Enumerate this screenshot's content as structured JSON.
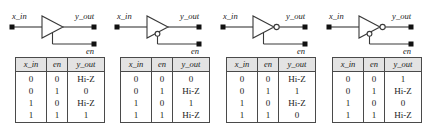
{
  "figure": {
    "background": "#ffffff",
    "line_color": "#3a3a3a",
    "header_fill": "#e3e3e3",
    "border_color": "#4a4a4a",
    "text_color": "#1a1a1a"
  },
  "columns": [
    "x_in",
    "en",
    "y_out"
  ],
  "panels": [
    {
      "id": "tristate-buffer-active-high",
      "signals": {
        "input": "x_in",
        "output": "y_out",
        "enable": "en"
      },
      "gate": {
        "type": "buffer",
        "output_bubble": false,
        "enable_bubble": false
      },
      "rows": [
        [
          "0",
          "0",
          "Hi-Z"
        ],
        [
          "0",
          "1",
          "0"
        ],
        [
          "1",
          "0",
          "Hi-Z"
        ],
        [
          "1",
          "1",
          "1"
        ]
      ]
    },
    {
      "id": "tristate-buffer-active-low",
      "signals": {
        "input": "x_in",
        "output": "y_out",
        "enable": "en"
      },
      "gate": {
        "type": "buffer",
        "output_bubble": false,
        "enable_bubble": true
      },
      "rows": [
        [
          "0",
          "0",
          "0"
        ],
        [
          "0",
          "1",
          "Hi-Z"
        ],
        [
          "1",
          "0",
          "1"
        ],
        [
          "1",
          "1",
          "Hi-Z"
        ]
      ]
    },
    {
      "id": "tristate-inverter-active-high",
      "signals": {
        "input": "x_in",
        "output": "y_out",
        "enable": "en"
      },
      "gate": {
        "type": "inverter",
        "output_bubble": true,
        "enable_bubble": false
      },
      "rows": [
        [
          "0",
          "0",
          "Hi-Z"
        ],
        [
          "0",
          "1",
          "1"
        ],
        [
          "1",
          "0",
          "Hi-Z"
        ],
        [
          "1",
          "1",
          "0"
        ]
      ]
    },
    {
      "id": "tristate-inverter-active-low",
      "signals": {
        "input": "x_in",
        "output": "y_out",
        "enable": "en"
      },
      "gate": {
        "type": "inverter",
        "output_bubble": true,
        "enable_bubble": true
      },
      "rows": [
        [
          "0",
          "0",
          "1"
        ],
        [
          "0",
          "1",
          "Hi-Z"
        ],
        [
          "1",
          "0",
          "0"
        ],
        [
          "1",
          "1",
          "Hi-Z"
        ]
      ]
    }
  ]
}
